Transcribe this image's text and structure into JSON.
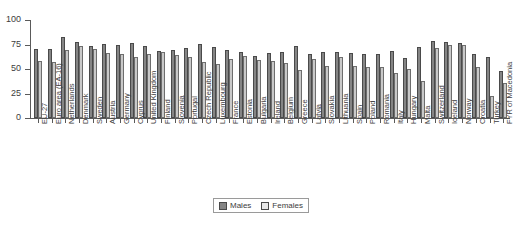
{
  "chart_data": {
    "type": "bar",
    "title": "",
    "subtitle": "",
    "xlabel": "",
    "ylabel": "",
    "ylim": [
      0,
      100
    ],
    "yticks": [
      0,
      25,
      50,
      75,
      100
    ],
    "grid": false,
    "legend_position": "bottom-center",
    "categories": [
      "EU-27",
      "Euro area (EA-16)",
      "Netherlands",
      "Denmark",
      "Sweden",
      "Austria",
      "Germany",
      "Cyprus",
      "United Kingdom",
      "Finland",
      "Slovenia",
      "Portugal",
      "Czech Republic",
      "Luxembourg",
      "France",
      "Estonia",
      "Bulgaria",
      "Ireland",
      "Belgium",
      "Greece",
      "Latvia",
      "Slovakia",
      "Lithuania",
      "Spain",
      "Poland",
      "Romania",
      "Italy",
      "Hungary",
      "Malta",
      "Switzerland",
      "Iceland",
      "Norway",
      "Croatia",
      "Turkey",
      "FYR of Macedonia"
    ],
    "series": [
      {
        "name": "Males",
        "color": "#858585",
        "values": [
          70.7,
          70.8,
          82.4,
          77.8,
          73.6,
          76.0,
          74.7,
          76.3,
          73.8,
          68.6,
          69.0,
          71.1,
          75.4,
          72.5,
          69.0,
          67.4,
          63.1,
          66.5,
          67.1,
          73.5,
          65.1,
          67.6,
          67.0,
          66.6,
          65.6,
          65.7,
          68.6,
          61.1,
          72.5,
          78.3,
          77.4,
          77.0,
          65.0,
          62.7,
          48.3
        ]
      },
      {
        "name": "Females",
        "color": "#c9c9c9",
        "values": [
          58.6,
          57.5,
          69.6,
          73.2,
          70.2,
          66.4,
          65.2,
          62.4,
          65.0,
          67.4,
          63.8,
          62.5,
          56.7,
          55.1,
          60.0,
          63.0,
          59.5,
          57.8,
          56.0,
          48.7,
          60.4,
          52.8,
          61.8,
          52.8,
          52.4,
          52.0,
          46.4,
          49.6,
          37.7,
          71.6,
          74.2,
          74.0,
          51.6,
          22.3,
          35.7
        ]
      }
    ],
    "legend": [
      {
        "label": "Males",
        "key": "males"
      },
      {
        "label": "Females",
        "key": "females"
      }
    ]
  }
}
